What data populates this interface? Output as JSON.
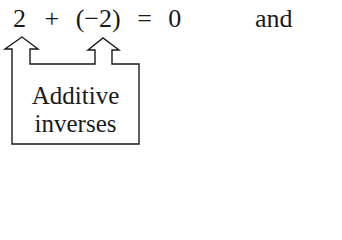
{
  "equation": {
    "left_operand": "2",
    "plus": "+",
    "open_paren": "(",
    "minus": "−",
    "right_operand": "2",
    "close_paren": ")",
    "equals": "=",
    "result": "0"
  },
  "connector_word": "and",
  "callout": {
    "line1": "Additive",
    "line2": "inverses"
  }
}
